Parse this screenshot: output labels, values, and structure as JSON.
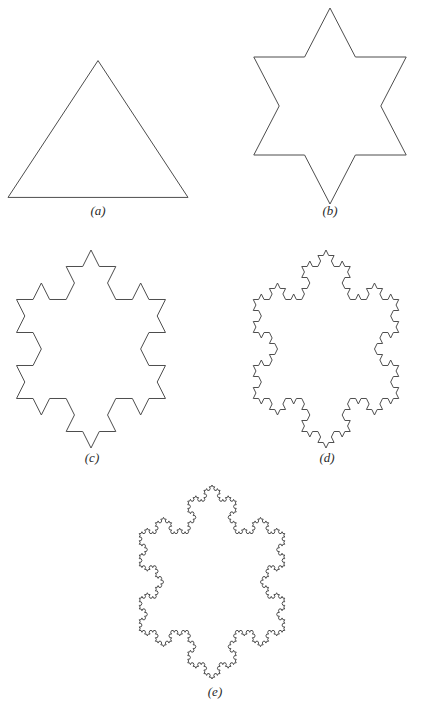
{
  "figure": {
    "background_color": "#ffffff",
    "stroke_color": "#4d4d4d",
    "panels": [
      {
        "id": "a",
        "label": "(a)",
        "label_letter": "a",
        "name": "koch-iteration-0-triangle",
        "iteration": 0,
        "shape": "equilateral triangle",
        "segments": 3
      },
      {
        "id": "b",
        "label": "(b)",
        "label_letter": "b",
        "name": "koch-iteration-1-star",
        "iteration": 1,
        "shape": "six-pointed star",
        "segments": 12
      },
      {
        "id": "c",
        "label": "(c)",
        "label_letter": "c",
        "name": "koch-iteration-2",
        "iteration": 2,
        "shape": "koch snowflake",
        "segments": 48
      },
      {
        "id": "d",
        "label": "(d)",
        "label_letter": "d",
        "name": "koch-iteration-3",
        "iteration": 3,
        "shape": "koch snowflake",
        "segments": 192
      },
      {
        "id": "e",
        "label": "(e)",
        "label_letter": "e",
        "name": "koch-iteration-4",
        "iteration": 4,
        "shape": "koch snowflake",
        "segments": 768
      }
    ]
  },
  "chart_data": {
    "type": "line",
    "title": "",
    "xlabel": "",
    "ylabel": "",
    "series": [
      {
        "name": "(a)",
        "iteration": 0,
        "segment_count": 3,
        "orientation": "apex-up"
      },
      {
        "name": "(b)",
        "iteration": 1,
        "segment_count": 12,
        "orientation": "apex-up"
      },
      {
        "name": "(c)",
        "iteration": 2,
        "segment_count": 48,
        "orientation": "apex-up"
      },
      {
        "name": "(d)",
        "iteration": 3,
        "segment_count": 192,
        "orientation": "apex-up"
      },
      {
        "name": "(e)",
        "iteration": 4,
        "segment_count": 768,
        "orientation": "apex-up"
      }
    ],
    "categories": [
      "(a)",
      "(b)",
      "(c)",
      "(d)",
      "(e)"
    ],
    "values": [
      3,
      12,
      48,
      192,
      768
    ],
    "grid": false,
    "legend": "none"
  }
}
